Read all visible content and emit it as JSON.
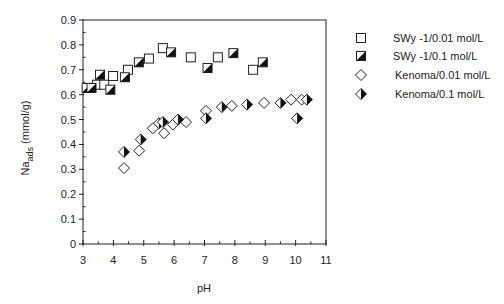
{
  "chart_data": {
    "type": "scatter",
    "title": "",
    "xlabel": "pH",
    "ylabel_main": "Na",
    "ylabel_sub": "ads",
    "ylabel_unit": " (mmol/g)",
    "xlim": [
      3,
      11
    ],
    "ylim": [
      0,
      0.9
    ],
    "xticks": [
      3,
      4,
      5,
      6,
      7,
      8,
      9,
      10,
      11
    ],
    "xtick_labels": [
      "3",
      "4",
      "5",
      "6",
      "7",
      "8",
      "9",
      "10",
      "11"
    ],
    "yticks": [
      0,
      0.1,
      0.2,
      0.3,
      0.4,
      0.5,
      0.6,
      0.7,
      0.8,
      0.9
    ],
    "ytick_labels": [
      "0",
      "0.1",
      "0.2",
      "0.3",
      "0.4",
      "0.5",
      "0.6",
      "0.7",
      "0.8",
      "0.9"
    ],
    "grid": false,
    "legend_position": "right",
    "series": [
      {
        "name": "SWy -1/0.01 mol/L",
        "marker": "square-open",
        "points": [
          [
            3.46,
            0.64
          ],
          [
            3.7,
            0.64
          ],
          [
            3.99,
            0.675
          ],
          [
            4.48,
            0.7
          ],
          [
            5.17,
            0.745
          ],
          [
            5.63,
            0.787
          ],
          [
            6.55,
            0.75
          ],
          [
            7.44,
            0.75
          ],
          [
            8.6,
            0.7
          ]
        ]
      },
      {
        "name": "SWy -1/0.1 mol/L",
        "marker": "square-half",
        "points": [
          [
            3.12,
            0.627
          ],
          [
            3.28,
            0.627
          ],
          [
            3.56,
            0.68
          ],
          [
            3.9,
            0.62
          ],
          [
            4.38,
            0.67
          ],
          [
            4.84,
            0.73
          ],
          [
            5.9,
            0.77
          ],
          [
            7.1,
            0.707
          ],
          [
            7.95,
            0.767
          ],
          [
            8.92,
            0.73
          ]
        ]
      },
      {
        "name": "Kenoma/0.01 mol/L",
        "marker": "diamond-open",
        "points": [
          [
            4.35,
            0.305
          ],
          [
            4.85,
            0.375
          ],
          [
            5.3,
            0.465
          ],
          [
            5.67,
            0.445
          ],
          [
            5.96,
            0.48
          ],
          [
            6.39,
            0.49
          ],
          [
            7.05,
            0.535
          ],
          [
            7.9,
            0.555
          ],
          [
            8.96,
            0.567
          ],
          [
            9.85,
            0.58
          ],
          [
            10.2,
            0.58
          ]
        ]
      },
      {
        "name": "Kenoma/0.1 mol/L",
        "marker": "diamond-half",
        "points": [
          [
            4.35,
            0.37
          ],
          [
            4.9,
            0.42
          ],
          [
            5.5,
            0.485
          ],
          [
            5.63,
            0.49
          ],
          [
            6.13,
            0.5
          ],
          [
            7.05,
            0.505
          ],
          [
            7.57,
            0.55
          ],
          [
            8.4,
            0.56
          ],
          [
            9.5,
            0.567
          ],
          [
            10.05,
            0.505
          ],
          [
            10.37,
            0.58
          ]
        ]
      }
    ]
  }
}
